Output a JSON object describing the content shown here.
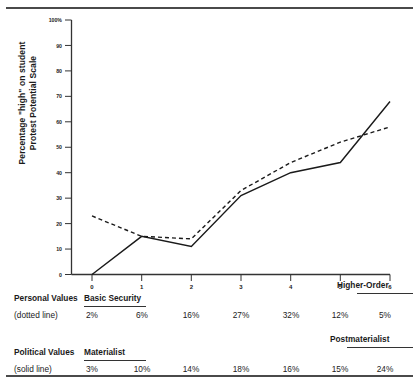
{
  "chart_data": {
    "type": "line",
    "title": "",
    "xlabel": "",
    "ylabel": "Percentage \"high\" on student\nProtest Potential Scale",
    "x": [
      0,
      1,
      2,
      3,
      4,
      5,
      6
    ],
    "xticklabels": [
      "0",
      "1",
      "2",
      "3",
      "4",
      "5",
      "6"
    ],
    "yticklabels": [
      "100%",
      "90",
      "80",
      "70",
      "60",
      "50",
      "40",
      "30",
      "20",
      "10",
      "0"
    ],
    "ylim": [
      0,
      100
    ],
    "xlim": [
      0,
      6
    ],
    "grid": false,
    "legend": "inline-table",
    "series": [
      {
        "name": "Personal Values (dotted line)",
        "style": "dotted",
        "left_anchor": "Basic Security",
        "right_anchor": "Higher-Order",
        "values": [
          2,
          6,
          16,
          27,
          32,
          12,
          5
        ],
        "plotted_y": [
          23,
          15,
          14,
          33,
          44,
          52,
          58
        ]
      },
      {
        "name": "Political Values (solid line)",
        "style": "solid",
        "left_anchor": "Materialist",
        "right_anchor": "Postmaterialist",
        "values": [
          3,
          10,
          14,
          18,
          16,
          15,
          24
        ],
        "plotted_y": [
          0,
          15,
          11,
          31,
          40,
          44,
          68
        ]
      }
    ]
  },
  "axis": {
    "y_top_label": "100%",
    "y_labels": [
      "100%",
      "90",
      "80",
      "70",
      "60",
      "50",
      "40",
      "30",
      "20",
      "10",
      "0"
    ],
    "x_labels": [
      "0",
      "1",
      "2",
      "3",
      "4",
      "5",
      "6"
    ],
    "y_title": "Percentage \"high\" on student\nProtest Potential Scale"
  },
  "table": {
    "rows": [
      {
        "label": "Personal Values",
        "sublabel": "(dotted line)",
        "left_anchor": "Basic Security",
        "right_anchor": "Higher-Order",
        "cells": [
          "2%",
          "6%",
          "16%",
          "27%",
          "32%",
          "12%",
          "5%"
        ]
      },
      {
        "label": "Political Values",
        "sublabel": "(solid line)",
        "left_anchor": "Materialist",
        "right_anchor": "Postmaterialist",
        "cells": [
          "3%",
          "10%",
          "14%",
          "18%",
          "16%",
          "15%",
          "24%"
        ]
      }
    ]
  },
  "colors": {
    "ink": "#1a1a1a",
    "axis": "#333333",
    "rule": "#4a4a4a",
    "background": "#ffffff"
  }
}
